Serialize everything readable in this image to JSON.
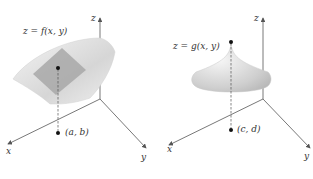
{
  "left_panel": {
    "surface_label": "z = f(x, y)",
    "point_label": "(a, b)",
    "axis_labels": {
      "x": "x",
      "y": "y",
      "z": "z"
    }
  },
  "right_panel": {
    "surface_label": "z = g(x, y)",
    "point_label": "(c, d)",
    "axis_labels": {
      "x": "x",
      "y": "y",
      "z": "z"
    }
  },
  "colors": {
    "axis": "#555555",
    "surface_light": "#f0f0f0",
    "surface_mid": "#c8c8c8",
    "plane": "#a8a8a8",
    "point": "#111111"
  }
}
